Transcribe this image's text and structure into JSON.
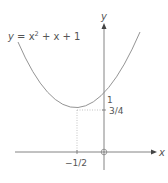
{
  "diagram": {
    "equation_label": {
      "y": "y",
      "eq": " = x",
      "sup": "2",
      "rest": " + x + 1"
    },
    "axes": {
      "x_label": "x",
      "y_label": "y",
      "origin_label": "O"
    },
    "annotations": {
      "y_intercept": "1",
      "vertex_y": "3/4",
      "vertex_x": "−1/2"
    },
    "colors": {
      "curve": "#888888",
      "axis": "#666666",
      "dotted": "#999999"
    }
  }
}
